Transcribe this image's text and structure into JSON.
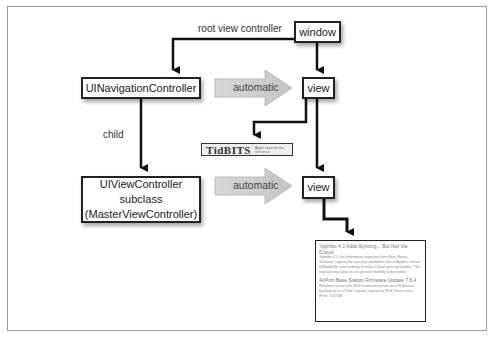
{
  "diagram": {
    "nodes": {
      "window": "window",
      "nav_controller": "UINavigationController",
      "vc_line1": "UIViewController subclass",
      "vc_line2": "(MasterViewController)",
      "view_top": "view",
      "view_bottom": "view"
    },
    "edge_labels": {
      "root_view_controller": "root view controller",
      "child": "child",
      "automatic_top": "automatic",
      "automatic_bottom": "automatic"
    },
    "logo": {
      "name": "TidBITS",
      "tagline": "Apple news for the rest of us"
    },
    "list": {
      "items": [
        {
          "title": "Yojimbo 4.0 Adds Syncing... But Not Via iCloud",
          "body": "Yojimbo 4.5, the information organizer from Bare Bones Software, regains the syncing capabilities lost to Apple's closure of MobileMe (and inability to make iCloud syncing reliable). The new syncing takes on an optional monthly subscription."
        },
        {
          "title": "AirPort Base Station Firmware Update 7.6.4",
          "body": "Resolves issues with Wi-Fi connectivity loss on iOS devices, backing up to a Time Capsule, and as an IPv6 Tunnel error. (Free, 726 KB)"
        }
      ]
    },
    "colors": {
      "stroke": "#111111",
      "auto_arrow_fill": "#cfcfcf",
      "border": "#9a9a9a"
    }
  }
}
